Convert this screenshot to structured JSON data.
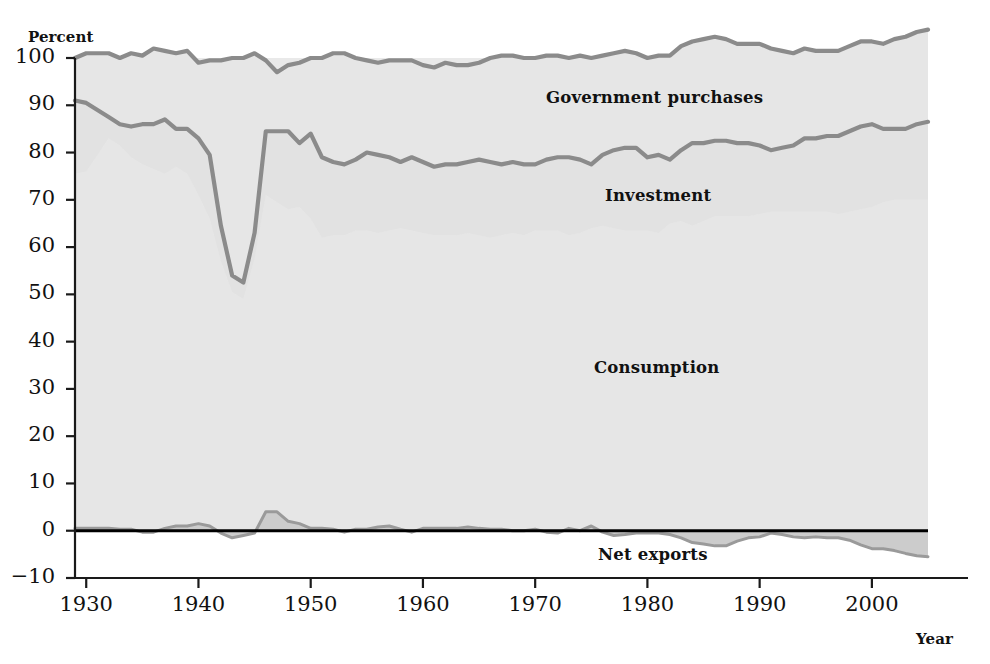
{
  "chart_data": {
    "type": "area",
    "title": "",
    "subtitle": "",
    "xlabel": "Year",
    "ylabel": "Percent",
    "xlim": [
      1929,
      2005
    ],
    "ylim": [
      -10,
      100
    ],
    "grid": false,
    "legend_position": "inline-annotations",
    "stacked": true,
    "annotations": [
      {
        "text": "Government purchases",
        "x": 1968,
        "y": 92
      },
      {
        "text": "Investment",
        "x": 1974,
        "y": 72
      },
      {
        "text": "Consumption",
        "x": 1973,
        "y": 36
      },
      {
        "text": "Net exports",
        "x": 1973,
        "y": -3.5
      }
    ],
    "ytick_labels": [
      "100",
      "90",
      "80",
      "70",
      "60",
      "50",
      "40",
      "30",
      "20",
      "10",
      "0",
      "-10"
    ],
    "yticks": [
      100,
      90,
      80,
      70,
      60,
      50,
      40,
      30,
      20,
      10,
      0,
      -10
    ],
    "xtick_labels": [
      "1930",
      "1940",
      "1950",
      "1960",
      "1970",
      "1980",
      "1990",
      "2000"
    ],
    "xticks": [
      1930,
      1940,
      1950,
      1960,
      1970,
      1980,
      1990,
      2000
    ],
    "x": [
      1929,
      1930,
      1931,
      1932,
      1933,
      1934,
      1935,
      1936,
      1937,
      1938,
      1939,
      1940,
      1941,
      1942,
      1943,
      1944,
      1945,
      1946,
      1947,
      1948,
      1949,
      1950,
      1951,
      1952,
      1953,
      1954,
      1955,
      1956,
      1957,
      1958,
      1959,
      1960,
      1961,
      1962,
      1963,
      1964,
      1965,
      1966,
      1967,
      1968,
      1969,
      1970,
      1971,
      1972,
      1973,
      1974,
      1975,
      1976,
      1977,
      1978,
      1979,
      1980,
      1981,
      1982,
      1983,
      1984,
      1985,
      1986,
      1987,
      1988,
      1989,
      1990,
      1991,
      1992,
      1993,
      1994,
      1995,
      1996,
      1997,
      1998,
      1999,
      2000,
      2001,
      2002,
      2003,
      2004,
      2005
    ],
    "series": [
      {
        "name": "Consumption",
        "color": "#d8d8d8",
        "line_color": "#8f8f8f",
        "values": [
          75.5,
          76.0,
          79.5,
          83.0,
          81.5,
          79.0,
          77.5,
          76.5,
          75.5,
          77.0,
          75.5,
          71.0,
          66.0,
          57.0,
          50.5,
          49.0,
          57.5,
          71.0,
          69.5,
          68.0,
          68.5,
          66.0,
          62.0,
          62.5,
          62.5,
          63.5,
          63.5,
          63.0,
          63.5,
          64.0,
          63.5,
          63.0,
          62.5,
          62.5,
          62.5,
          63.0,
          62.5,
          62.0,
          62.5,
          63.0,
          62.5,
          63.5,
          63.5,
          63.5,
          62.5,
          63.0,
          64.0,
          64.5,
          64.0,
          63.5,
          63.5,
          63.5,
          63.0,
          65.0,
          65.5,
          64.5,
          65.5,
          66.5,
          66.5,
          66.5,
          66.5,
          67.0,
          67.5,
          67.5,
          67.5,
          67.5,
          67.5,
          67.5,
          67.0,
          67.5,
          68.0,
          68.5,
          69.5,
          70.0,
          70.0,
          70.0,
          70.0
        ]
      },
      {
        "name": "Investment",
        "color": "#e3e3e3",
        "line_color": "#8f8f8f",
        "values": [
          15.5,
          14.5,
          9.5,
          4.5,
          4.5,
          6.5,
          8.5,
          9.5,
          11.5,
          8.0,
          9.5,
          12.0,
          13.5,
          7.5,
          3.5,
          3.5,
          5.5,
          13.5,
          15.0,
          16.5,
          13.5,
          18.0,
          17.0,
          15.5,
          15.0,
          15.0,
          16.5,
          16.5,
          15.5,
          14.0,
          15.5,
          15.0,
          14.5,
          15.0,
          15.0,
          15.0,
          16.0,
          16.0,
          15.0,
          15.0,
          15.0,
          14.0,
          15.0,
          15.5,
          16.5,
          15.5,
          13.5,
          15.0,
          16.5,
          17.5,
          17.5,
          15.5,
          16.5,
          13.5,
          15.0,
          17.5,
          16.5,
          16.0,
          16.0,
          15.5,
          15.5,
          14.5,
          13.0,
          13.5,
          14.0,
          15.5,
          15.5,
          16.0,
          16.5,
          17.0,
          17.5,
          17.5,
          15.5,
          15.0,
          15.0,
          16.0,
          16.5
        ]
      },
      {
        "name": "Government purchases",
        "color": "#dcdcdc",
        "line_color": "#8f8f8f",
        "values": [
          9.0,
          10.5,
          12.0,
          13.5,
          14.0,
          15.5,
          14.5,
          16.0,
          14.5,
          16.0,
          16.5,
          16.0,
          20.0,
          35.0,
          46.0,
          47.5,
          38.0,
          15.0,
          12.5,
          14.0,
          17.0,
          16.0,
          21.0,
          23.0,
          23.5,
          21.5,
          19.5,
          19.5,
          20.5,
          21.5,
          20.5,
          20.5,
          21.0,
          21.5,
          21.0,
          20.5,
          20.5,
          22.0,
          23.0,
          22.5,
          22.5,
          22.5,
          22.0,
          21.5,
          21.0,
          22.0,
          22.5,
          21.0,
          20.5,
          20.5,
          20.0,
          21.0,
          21.0,
          22.0,
          22.0,
          21.5,
          22.0,
          22.0,
          21.5,
          21.0,
          21.0,
          21.5,
          21.5,
          20.5,
          19.5,
          19.0,
          18.5,
          18.0,
          18.0,
          18.0,
          18.0,
          17.5,
          18.0,
          19.0,
          19.5,
          19.5,
          19.5
        ]
      },
      {
        "name": "Net exports",
        "color": "#cfcfcf",
        "line_color": "#8f8f8f",
        "values": [
          0.5,
          0.5,
          0.5,
          0.5,
          0.3,
          0.3,
          -0.3,
          -0.3,
          0.5,
          1.0,
          1.0,
          1.5,
          1.0,
          -0.5,
          -1.5,
          -1.0,
          -0.5,
          4.0,
          4.0,
          2.0,
          1.5,
          0.5,
          0.5,
          0.3,
          -0.3,
          0.3,
          0.3,
          0.8,
          1.0,
          0.3,
          -0.3,
          0.5,
          0.5,
          0.5,
          0.5,
          0.8,
          0.5,
          0.3,
          0.3,
          0.0,
          0.0,
          0.3,
          -0.3,
          -0.5,
          0.5,
          0.0,
          1.0,
          -0.3,
          -1.0,
          -0.8,
          -0.5,
          -0.5,
          -0.5,
          -0.8,
          -1.5,
          -2.5,
          -2.8,
          -3.2,
          -3.2,
          -2.2,
          -1.5,
          -1.3,
          -0.5,
          -0.8,
          -1.3,
          -1.5,
          -1.3,
          -1.5,
          -1.5,
          -2.0,
          -3.0,
          -3.8,
          -3.8,
          -4.2,
          -4.8,
          -5.3,
          -5.5
        ]
      }
    ]
  },
  "axes": {
    "y_title": "Percent",
    "x_title": "Year"
  },
  "colors": {
    "plot_background": "#e9e9e9",
    "line": "#8b8b8b",
    "zero_line": "#000000",
    "axis": "#1a1a1a",
    "text": "#111111"
  },
  "labels": {
    "government": "Government purchases",
    "investment": "Investment",
    "consumption": "Consumption",
    "net_exports": "Net exports"
  }
}
